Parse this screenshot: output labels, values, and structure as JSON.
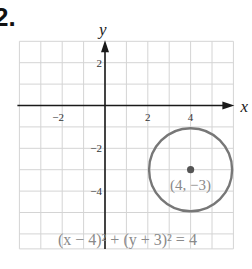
{
  "problem_number": "2.",
  "chart_data": {
    "type": "scatter",
    "title": "",
    "xlabel": "x",
    "ylabel": "y",
    "xlim": [
      -4,
      6
    ],
    "ylim": [
      -6.7,
      3
    ],
    "grid": true,
    "x_ticks": [
      {
        "value": -2,
        "label": "−2"
      },
      {
        "value": 2,
        "label": "2"
      },
      {
        "value": 4,
        "label": "4"
      }
    ],
    "y_ticks": [
      {
        "value": 2,
        "label": "2"
      },
      {
        "value": -2,
        "label": "−2"
      },
      {
        "value": -4,
        "label": "−4"
      }
    ],
    "shapes": [
      {
        "kind": "circle",
        "center": [
          4,
          -3
        ],
        "radius": 2,
        "color": "#777777"
      }
    ],
    "points": [
      {
        "x": 4,
        "y": -3,
        "label": "(4, −3)",
        "color": "#555555"
      }
    ],
    "equation": "(x − 4)² + (y + 3)² = 4"
  },
  "colors": {
    "grid": "#d4d4d4",
    "axis": "#1a1a1a",
    "circle": "#777777",
    "label_text": "#8a8a8a"
  }
}
